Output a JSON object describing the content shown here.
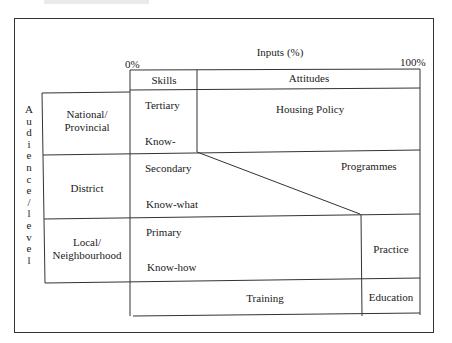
{
  "diagram": {
    "header_fragment": "",
    "axis": {
      "title": "Inputs (%)",
      "min_label": "0%",
      "max_label": "100%"
    },
    "vertical_axis": {
      "label": "Audience/level",
      "letters": [
        "A",
        "u",
        "d",
        "i",
        "e",
        "n",
        "c",
        "e",
        "/",
        "l",
        "e",
        "v",
        "e",
        "l"
      ]
    },
    "columns": {
      "skills": "Skills",
      "attitudes": "Attitudes"
    },
    "levels": [
      {
        "name": "National/ Provincial",
        "line1": "National/",
        "line2": "Provincial",
        "skill_level": "Tertiary",
        "knowledge": "Know-"
      },
      {
        "name": "District",
        "line1": "District",
        "skill_level": "Secondary",
        "knowledge": "Know-what"
      },
      {
        "name": "Local/ Neighbourhood",
        "line1": "Local/",
        "line2": "Neighbourhood",
        "skill_level": "Primary",
        "knowledge": "Know-how"
      }
    ],
    "regions": {
      "housing_policy": "Housing Policy",
      "programmes": "Programmes",
      "practice": "Practice",
      "training": "Training",
      "education": "Education"
    },
    "colors": {
      "line": "#333333",
      "text": "#222222",
      "background": "#ffffff"
    }
  }
}
